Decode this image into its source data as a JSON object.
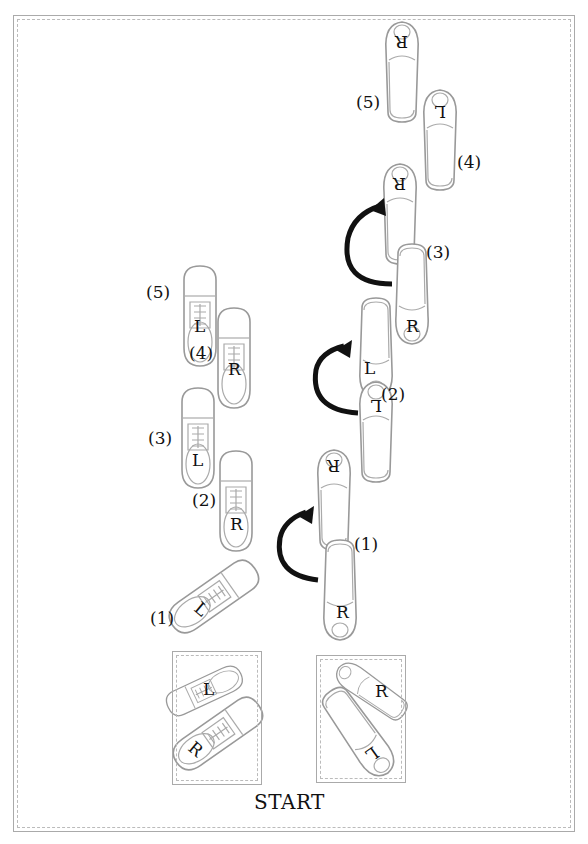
{
  "diagram": {
    "start_label": "START",
    "mens_steps": [
      {
        "step": "(1)",
        "foot": "L"
      },
      {
        "step": "(2)",
        "foot": "R"
      },
      {
        "step": "(3)",
        "foot": "L"
      },
      {
        "step": "(4)",
        "foot": "R"
      },
      {
        "step": "(5)",
        "foot": "L"
      }
    ],
    "womens_steps": [
      {
        "step": "(1)",
        "foot": "R"
      },
      {
        "step": "(2)",
        "foot": "L"
      },
      {
        "step": "(3)",
        "foot": "R"
      },
      {
        "step": "(4)",
        "foot": "L"
      },
      {
        "step": "(5)",
        "foot": "R"
      }
    ],
    "start_position": {
      "men": [
        "L",
        "R"
      ],
      "women": [
        "R",
        "L"
      ]
    },
    "foot_letters": {
      "L": "L",
      "R": "R"
    }
  }
}
